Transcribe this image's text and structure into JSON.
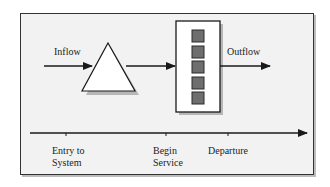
{
  "diagram": {
    "type": "queueing-system-flow",
    "colors": {
      "background": "#f2f2f2",
      "frame_border": "#333333",
      "shadow": "#a8a8a8",
      "line": "#1a1a1a",
      "queue_fill": "#ffffff",
      "server_fill": "#ffffff",
      "customer_fill": "#6e6e6e"
    },
    "flow": {
      "inflow_label": "Inflow",
      "outflow_label": "Outflow"
    },
    "queue": {
      "shape": "triangle",
      "icon": "queue-triangle-icon"
    },
    "server": {
      "shape": "rectangle",
      "icon": "server-box-icon",
      "customer_count": 5
    },
    "timeline": {
      "events": [
        {
          "line1": "Entry to",
          "line2": "System"
        },
        {
          "line1": "Begin",
          "line2": "Service"
        },
        {
          "line1": "Departure",
          "line2": ""
        }
      ]
    }
  }
}
